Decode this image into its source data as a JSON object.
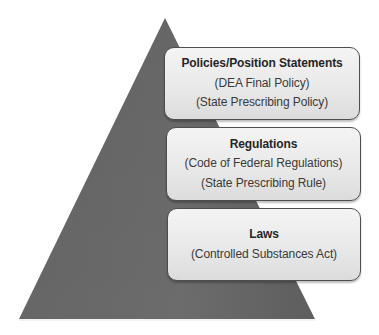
{
  "diagram": {
    "type": "pyramid",
    "colors": {
      "pyramid_fill": "#6a6a6a",
      "pyramid_edge": "#555555",
      "box_fill_top": "#f4f4f4",
      "box_fill_bottom": "#dcdcdc",
      "box_border": "#4e4e4e",
      "text": "#2b2b2b"
    },
    "tiers": [
      {
        "title": "Policies/Position Statements",
        "lines": [
          "(DEA Final Policy)",
          "(State Prescribing Policy)"
        ]
      },
      {
        "title": "Regulations",
        "lines": [
          "(Code of Federal Regulations)",
          "(State Prescribing Rule)"
        ]
      },
      {
        "title": "Laws",
        "lines": [
          "(Controlled Substances Act)"
        ]
      }
    ]
  }
}
